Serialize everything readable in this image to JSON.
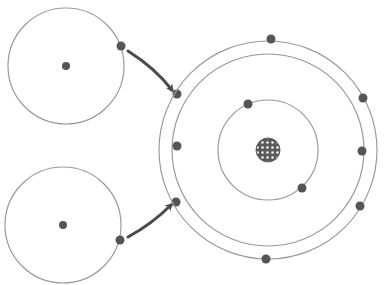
{
  "diagram": {
    "title": "",
    "colors": {
      "orbit": "#9a9a9a",
      "electron": "#555555",
      "arrow": "#4a4a4a",
      "nucleus": "#5a5a5a",
      "background": "#ffffff"
    },
    "donor_atoms": [
      {
        "name": "donor-atom-top",
        "center": [
          66,
          66
        ],
        "orbit_radius": 58,
        "nucleus_radius": 4,
        "electron": [
          121,
          46
        ],
        "arrow": {
          "from": [
            128,
            51
          ],
          "ctrl": [
            155,
            68
          ],
          "to": [
            172,
            90
          ]
        }
      },
      {
        "name": "donor-atom-bottom",
        "center": [
          63,
          225
        ],
        "orbit_radius": 58,
        "nucleus_radius": 4,
        "electron": [
          120,
          240
        ],
        "arrow": {
          "from": [
            128,
            237
          ],
          "ctrl": [
            152,
            224
          ],
          "to": [
            171,
            205
          ]
        }
      }
    ],
    "acceptor_atom": {
      "center": [
        268,
        150
      ],
      "nucleus_radius": 12,
      "orbits": [
        {
          "name": "inner-shell",
          "radius": 50,
          "electrons": [
            [
              248,
              104
            ],
            [
              302,
              188
            ]
          ]
        },
        {
          "name": "second-shell",
          "radius": 96,
          "electrons": [
            [
              177,
              94
            ],
            [
              177,
              146
            ],
            [
              176,
              202
            ]
          ]
        },
        {
          "name": "outer-shell",
          "radius": 109,
          "electrons": [
            [
              271,
              39
            ],
            [
              363,
              98
            ],
            [
              362,
              151
            ],
            [
              360,
              206
            ],
            [
              266,
              259
            ]
          ]
        }
      ]
    }
  }
}
